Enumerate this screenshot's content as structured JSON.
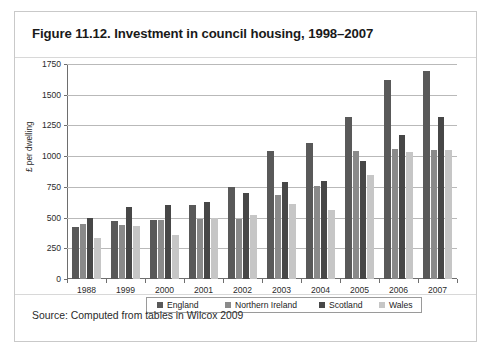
{
  "figure": {
    "title": "Figure 11.12. Investment in council housing, 1998–2007",
    "source": "Source: Computed from tables in Wilcox 2009"
  },
  "colors": {
    "england": "#595959",
    "northern_ireland": "#8a8a8a",
    "scotland": "#474747",
    "wales": "#c6c6c6",
    "axis": "#6e6e6e",
    "gridline": "#b9b9b9",
    "card_border": "#c9c9c9"
  },
  "chart_data": {
    "type": "bar",
    "title": "Figure 11.12. Investment in council housing, 1998–2007",
    "xlabel": "",
    "ylabel": "£ per dwelling",
    "ylim": [
      0,
      1750
    ],
    "ytick_step": 250,
    "yticks": [
      0,
      250,
      500,
      750,
      1000,
      1250,
      1500,
      1750
    ],
    "ytick_labels": [
      "0",
      "250",
      "500",
      "750",
      "1000",
      "1250",
      "1500",
      "1750"
    ],
    "grid": true,
    "legend_position": "bottom",
    "categories": [
      "1988",
      "1999",
      "2000",
      "2001",
      "2002",
      "2003",
      "2004",
      "2005",
      "2006",
      "2007"
    ],
    "series": [
      {
        "name": "England",
        "values": [
          420,
          470,
          480,
          600,
          750,
          1040,
          1110,
          1320,
          1620,
          1690
        ]
      },
      {
        "name": "Northern Ireland",
        "values": [
          450,
          440,
          480,
          490,
          490,
          680,
          760,
          1040,
          1060,
          1050
        ]
      },
      {
        "name": "Scotland",
        "values": [
          500,
          590,
          600,
          630,
          700,
          790,
          800,
          960,
          1170,
          1320
        ]
      },
      {
        "name": "Wales",
        "values": [
          330,
          430,
          360,
          500,
          520,
          610,
          560,
          850,
          1030,
          1050
        ]
      }
    ]
  },
  "legend": {
    "items": [
      {
        "label": "England"
      },
      {
        "label": "Northern Ireland"
      },
      {
        "label": "Scotland"
      },
      {
        "label": "Wales"
      }
    ]
  }
}
